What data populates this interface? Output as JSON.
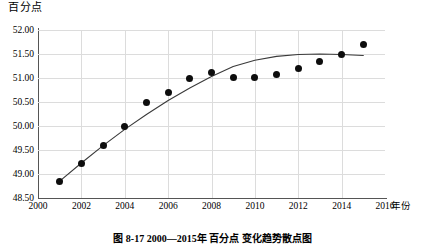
{
  "figure": {
    "y_axis_title": "百分点",
    "x_axis_title": "年份",
    "caption": "图 8-17  2000—2015年 百分点 变化趋势散点图"
  },
  "chart_data": {
    "type": "scatter",
    "title": "",
    "xlabel": "年份",
    "ylabel": "百分点",
    "xlim": [
      2000,
      2016
    ],
    "ylim": [
      48.5,
      52.0
    ],
    "xticks": [
      2000,
      2002,
      2004,
      2006,
      2008,
      2010,
      2012,
      2014,
      2016
    ],
    "yticks": [
      48.5,
      49.0,
      49.5,
      50.0,
      50.5,
      51.0,
      51.5,
      52.0
    ],
    "ytick_labels": [
      "48.50",
      "49.00",
      "49.50",
      "50.00",
      "50.50",
      "51.00",
      "51.50",
      "52.00"
    ],
    "xtick_labels": [
      "2000",
      "2002",
      "2004",
      "2006",
      "2008",
      "2010",
      "2012",
      "2014",
      "2016"
    ],
    "grid": true,
    "legend": "none",
    "marker_color": "#0d0d0d",
    "curve_color": "#3a3a3a",
    "grid_color": "#dcdcdc",
    "x": [
      2001,
      2002,
      2003,
      2004,
      2005,
      2006,
      2007,
      2008,
      2009,
      2010,
      2011,
      2012,
      2013,
      2014,
      2015
    ],
    "y": [
      48.85,
      49.21,
      49.6,
      50.0,
      50.48,
      50.7,
      51.0,
      51.12,
      51.01,
      51.01,
      51.07,
      51.2,
      51.35,
      51.48,
      51.7
    ],
    "series": [
      {
        "name": "观测值",
        "type": "scatter",
        "values": [
          48.85,
          49.21,
          49.6,
          50.0,
          50.48,
          50.7,
          51.0,
          51.12,
          51.01,
          51.01,
          51.07,
          51.2,
          51.35,
          51.48,
          51.7
        ]
      },
      {
        "name": "拟合曲线",
        "type": "line",
        "x": [
          2001,
          2002,
          2003,
          2004,
          2005,
          2006,
          2007,
          2008,
          2009,
          2010,
          2011,
          2012,
          2013,
          2014,
          2015
        ],
        "values": [
          48.85,
          49.23,
          49.59,
          49.93,
          50.24,
          50.53,
          50.79,
          51.03,
          51.24,
          51.37,
          51.45,
          51.49,
          51.5,
          51.49,
          51.47
        ]
      }
    ]
  }
}
